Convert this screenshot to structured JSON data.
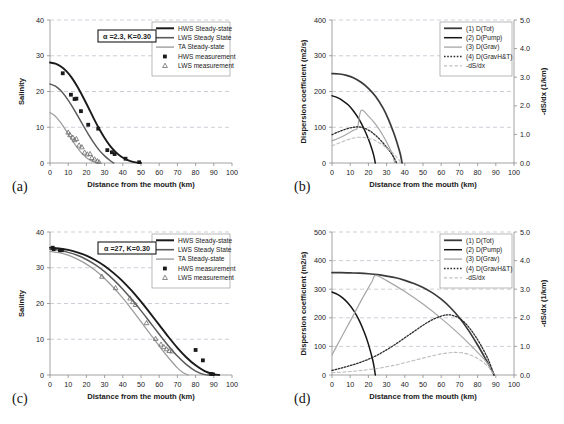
{
  "figure": {
    "panels": [
      "a",
      "b",
      "c",
      "d"
    ]
  },
  "common": {
    "xlabel": "Distance from the mouth (km)",
    "xticks": [
      0,
      10,
      20,
      30,
      40,
      50,
      60,
      70,
      80,
      90,
      100
    ],
    "xlim": [
      0,
      100
    ]
  },
  "colors": {
    "hws": "#1a1a1a",
    "lws": "#5a5a5a",
    "ta": "#9e9e9e",
    "dtot": "#3a3a3a",
    "dpump": "#161616",
    "dgrav": "#a6a6a6",
    "dgravht": "#2b2b2b",
    "dsdx": "#bdbdbd",
    "grid": "#b9b9c8",
    "axis": "#8a8a8a"
  },
  "chart_data": [
    {
      "id": "a",
      "panel_label": "(a)",
      "type": "line",
      "title": "",
      "xlabel": "Distance from the mouth (km)",
      "ylabel": "Salinity",
      "xlim": [
        0,
        100
      ],
      "ylim": [
        0,
        40
      ],
      "xticks": [
        0,
        10,
        20,
        30,
        40,
        50,
        60,
        70,
        80,
        90,
        100
      ],
      "yticks": [
        0,
        10,
        20,
        30,
        40
      ],
      "grid": true,
      "legend_position": "top-right",
      "annotation": "α =2.3, K=0.30",
      "legend": [
        {
          "label": "HWS Steady-state",
          "marker": "line",
          "color": "#1a1a1a",
          "width": 2.0
        },
        {
          "label": "LWS Steady State",
          "marker": "line",
          "color": "#5a5a5a",
          "width": 1.6
        },
        {
          "label": "TA Steady-state",
          "marker": "line",
          "color": "#9e9e9e",
          "width": 1.4
        },
        {
          "label": "HWS measurement",
          "marker": "square",
          "color": "#1a1a1a"
        },
        {
          "label": "LWS measurement",
          "marker": "triangle",
          "color": "#6b6b6b"
        }
      ],
      "series": [
        {
          "name": "HWS Steady-state",
          "style": "line",
          "color": "#1a1a1a",
          "x": [
            0,
            3,
            6,
            9,
            12,
            15,
            18,
            21,
            24,
            27,
            30,
            33,
            36,
            39,
            42,
            45,
            48,
            50
          ],
          "y": [
            28.1,
            27.8,
            27.0,
            25.7,
            23.8,
            21.4,
            18.6,
            15.6,
            12.5,
            9.6,
            7.0,
            4.8,
            3.1,
            1.8,
            0.95,
            0.4,
            0.1,
            0.0
          ]
        },
        {
          "name": "LWS Steady State",
          "style": "line",
          "color": "#5a5a5a",
          "x": [
            0,
            3,
            6,
            9,
            12,
            15,
            18,
            21,
            24,
            27,
            30,
            33,
            35
          ],
          "y": [
            22.1,
            21.5,
            20.2,
            18.3,
            16.0,
            13.4,
            10.7,
            8.1,
            5.7,
            3.6,
            2.0,
            0.7,
            0.0
          ]
        },
        {
          "name": "TA Steady-state",
          "style": "line",
          "color": "#9e9e9e",
          "x": [
            0,
            2,
            4,
            6,
            8,
            10,
            12,
            14,
            16,
            18,
            20,
            22,
            24,
            26,
            27
          ],
          "y": [
            14.1,
            13.5,
            12.5,
            11.2,
            9.7,
            8.1,
            6.5,
            5.0,
            3.6,
            2.4,
            1.5,
            0.8,
            0.3,
            0.05,
            0.0
          ]
        },
        {
          "name": "HWS measurement",
          "style": "square",
          "color": "#1a1a1a",
          "x": [
            7.0,
            11.5,
            13.5,
            14.5,
            17.0,
            21.0,
            26.5,
            31.5,
            34.0,
            35.5,
            41.5,
            49.0
          ],
          "y": [
            25.1,
            19.1,
            17.9,
            18.0,
            14.5,
            10.7,
            9.6,
            3.6,
            3.0,
            2.5,
            1.2,
            0.2
          ]
        },
        {
          "name": "LWS measurement",
          "style": "triangle",
          "color": "#6b6b6b",
          "x": [
            10.0,
            11.0,
            12.5,
            13.5,
            14.5,
            16.0,
            17.5,
            19.0,
            20.5,
            22.0,
            23.0,
            24.5,
            26.0,
            27.0
          ],
          "y": [
            8.6,
            7.9,
            7.2,
            6.5,
            6.8,
            5.0,
            4.5,
            3.0,
            2.5,
            2.6,
            1.5,
            1.1,
            0.6,
            0.3
          ]
        }
      ]
    },
    {
      "id": "b",
      "panel_label": "(b)",
      "type": "line",
      "title": "",
      "xlabel": "Distance from the mouth (km)",
      "ylabel": "Dispersion coefficient (m2/s)",
      "ylabel_right": "-dS/dx (1/km)",
      "xlim": [
        0,
        100
      ],
      "ylim": [
        0,
        400
      ],
      "ylim_right": [
        0,
        5.0
      ],
      "xticks": [
        0,
        10,
        20,
        30,
        40,
        50,
        60,
        70,
        80,
        90,
        100
      ],
      "yticks": [
        0,
        100,
        200,
        300,
        400
      ],
      "yticks_right": [
        "0.0",
        "1.0",
        "2.0",
        "3.0",
        "4.0",
        "5.0"
      ],
      "grid": true,
      "legend_position": "top-right",
      "legend": [
        {
          "label": "(1) D(Tot)",
          "marker": "line",
          "color": "#3a3a3a",
          "width": 1.8
        },
        {
          "label": "(2) D(Pump)",
          "marker": "line",
          "color": "#161616",
          "width": 1.5
        },
        {
          "label": "(3) D(Grav)",
          "marker": "line",
          "color": "#a6a6a6",
          "width": 1.3
        },
        {
          "label": "(4) D(GravH&T)",
          "marker": "dotted",
          "color": "#2b2b2b",
          "width": 1.3
        },
        {
          "label": "-dS/dx",
          "marker": "dashed",
          "color": "#bdbdbd",
          "width": 1.1
        }
      ],
      "series": [
        {
          "name": "(1) D(Tot)",
          "style": "line",
          "color": "#3a3a3a",
          "x": [
            0,
            4,
            8,
            12,
            16,
            20,
            24,
            28,
            31,
            34,
            36,
            37.5,
            38.5
          ],
          "y": [
            250,
            249,
            245,
            238,
            226,
            209,
            186,
            154,
            122,
            83,
            52,
            26,
            0
          ]
        },
        {
          "name": "(2) D(Pump)",
          "style": "line",
          "color": "#161616",
          "x": [
            0,
            3,
            6,
            9,
            12,
            15,
            18,
            20,
            22,
            23,
            23.8
          ],
          "y": [
            188,
            183,
            174,
            162,
            144,
            121,
            91,
            67,
            38,
            20,
            0
          ]
        },
        {
          "name": "(3) D(Grav)",
          "style": "line",
          "color": "#a6a6a6",
          "x": [
            0,
            3,
            6,
            9,
            12,
            14,
            16,
            20,
            24,
            28,
            31,
            33,
            34.5
          ],
          "y": [
            62,
            68,
            75,
            83,
            92,
            99,
            147,
            131,
            108,
            77,
            49,
            27,
            0
          ]
        },
        {
          "name": "(4) D(GravH&T)",
          "style": "dotted",
          "color": "#2b2b2b",
          "x": [
            0,
            3,
            6,
            9,
            12,
            14,
            16,
            18,
            21,
            24,
            27,
            30,
            32,
            34,
            35.5
          ],
          "y": [
            79,
            86,
            92,
            97,
            100,
            101,
            100,
            97,
            89,
            77,
            62,
            44,
            31,
            16,
            0
          ]
        },
        {
          "name": "-dS/dx",
          "style": "dashed",
          "color": "#bdbdbd",
          "x": [
            0,
            3,
            6,
            9,
            12,
            15,
            18,
            21,
            24,
            27,
            30,
            33,
            36,
            38
          ],
          "y": [
            48,
            54,
            60,
            66,
            70,
            72,
            71,
            68,
            62,
            53,
            42,
            30,
            14,
            0
          ]
        }
      ]
    },
    {
      "id": "c",
      "panel_label": "(c)",
      "type": "line",
      "title": "",
      "xlabel": "Distance from the mouth (km)",
      "ylabel": "Salinity",
      "xlim": [
        0,
        100
      ],
      "ylim": [
        0,
        40
      ],
      "xticks": [
        0,
        10,
        20,
        30,
        40,
        50,
        60,
        70,
        80,
        90,
        100
      ],
      "yticks": [
        0,
        10,
        20,
        30,
        40
      ],
      "grid": true,
      "legend_position": "top-right",
      "annotation": "α =27, K=0.30",
      "legend": [
        {
          "label": "HWS Steady-state",
          "marker": "line",
          "color": "#1a1a1a",
          "width": 2.0
        },
        {
          "label": "LWS Steady State",
          "marker": "line",
          "color": "#5a5a5a",
          "width": 1.6
        },
        {
          "label": "TA Steady-state",
          "marker": "line",
          "color": "#9e9e9e",
          "width": 1.4
        },
        {
          "label": "HWS measurement",
          "marker": "square",
          "color": "#1a1a1a"
        },
        {
          "label": "LWS measurement",
          "marker": "triangle",
          "color": "#6b6b6b"
        }
      ],
      "series": [
        {
          "name": "HWS Steady-state",
          "style": "line",
          "color": "#1a1a1a",
          "x": [
            0,
            5,
            10,
            15,
            20,
            25,
            30,
            35,
            40,
            45,
            50,
            55,
            60,
            65,
            70,
            75,
            80,
            85,
            90,
            93
          ],
          "y": [
            35.6,
            35.4,
            35.0,
            34.3,
            33.4,
            32.1,
            30.5,
            28.5,
            26.2,
            23.5,
            20.5,
            17.3,
            14.0,
            10.7,
            7.6,
            4.9,
            2.7,
            1.1,
            0.2,
            0.0
          ]
        },
        {
          "name": "LWS Steady State",
          "style": "line",
          "color": "#5a5a5a",
          "x": [
            0,
            5,
            10,
            15,
            20,
            25,
            30,
            35,
            40,
            45,
            50,
            55,
            60,
            65,
            70,
            75,
            80,
            85,
            88
          ],
          "y": [
            35.2,
            34.9,
            34.3,
            33.5,
            32.3,
            30.8,
            28.9,
            26.6,
            24.0,
            21.1,
            18.0,
            14.7,
            11.4,
            8.2,
            5.3,
            2.9,
            1.1,
            0.1,
            0.0
          ]
        },
        {
          "name": "TA Steady-state",
          "style": "line",
          "color": "#9e9e9e",
          "x": [
            0,
            5,
            10,
            15,
            20,
            25,
            30,
            35,
            40,
            45,
            50,
            55,
            60,
            65,
            70,
            73,
            76
          ],
          "y": [
            34.6,
            34.2,
            33.5,
            32.4,
            31.0,
            29.2,
            27.0,
            24.4,
            21.5,
            18.3,
            14.9,
            11.5,
            8.1,
            4.9,
            2.0,
            0.7,
            0.0
          ]
        },
        {
          "name": "HWS measurement",
          "style": "square",
          "color": "#1a1a1a",
          "x": [
            1.5,
            2.0,
            5.5,
            6.5,
            80.0,
            84.0,
            88.5,
            89.5
          ],
          "y": [
            35.6,
            35.2,
            34.9,
            34.9,
            7.0,
            4.1,
            0.3,
            0.2
          ]
        },
        {
          "name": "LWS measurement",
          "style": "triangle",
          "color": "#6b6b6b",
          "x": [
            28.5,
            36.0,
            44.0,
            45.5,
            47.0,
            53.0,
            58.0,
            61.0,
            62.5,
            64.0,
            65.5,
            67.0
          ],
          "y": [
            27.6,
            24.4,
            21.5,
            20.5,
            19.7,
            14.6,
            10.2,
            8.6,
            7.9,
            7.3,
            6.8,
            6.7
          ]
        }
      ]
    },
    {
      "id": "d",
      "panel_label": "(d)",
      "type": "line",
      "title": "",
      "xlabel": "Distance from the mouth (km)",
      "ylabel": "Dispersion coefficient (m2/s)",
      "ylabel_right": "-dS/dx (1/km)",
      "xlim": [
        0,
        100
      ],
      "ylim": [
        0,
        500
      ],
      "ylim_right": [
        0,
        5.0
      ],
      "xticks": [
        0,
        10,
        20,
        30,
        40,
        50,
        60,
        70,
        80,
        90,
        100
      ],
      "yticks": [
        0,
        100,
        200,
        300,
        400,
        500
      ],
      "yticks_right": [
        "0.0",
        "1.0",
        "2.0",
        "3.0",
        "4.0",
        "5.0"
      ],
      "grid": true,
      "legend_position": "top-right",
      "legend": [
        {
          "label": "(1) D(Tot)",
          "marker": "line",
          "color": "#3a3a3a",
          "width": 1.8
        },
        {
          "label": "(2) D(Pump)",
          "marker": "line",
          "color": "#161616",
          "width": 1.5
        },
        {
          "label": "(3) D(Grav)",
          "marker": "line",
          "color": "#a6a6a6",
          "width": 1.3
        },
        {
          "label": "(4) D(GravH&T)",
          "marker": "dotted",
          "color": "#2b2b2b",
          "width": 1.3
        },
        {
          "label": "-dS/dx",
          "marker": "dashed",
          "color": "#bdbdbd",
          "width": 1.1
        }
      ],
      "series": [
        {
          "name": "(1) D(Tot)",
          "style": "line",
          "color": "#3a3a3a",
          "x": [
            0,
            5,
            10,
            15,
            20,
            25,
            30,
            35,
            40,
            45,
            50,
            55,
            60,
            65,
            70,
            75,
            80,
            84,
            87,
            89
          ],
          "y": [
            358,
            358,
            357,
            356,
            354,
            351,
            346,
            340,
            331,
            320,
            306,
            288,
            265,
            236,
            200,
            156,
            105,
            61,
            26,
            0
          ]
        },
        {
          "name": "(2) D(Pump)",
          "style": "line",
          "color": "#161616",
          "x": [
            0,
            3,
            6,
            9,
            12,
            15,
            18,
            20,
            22,
            23,
            23.8
          ],
          "y": [
            290,
            282,
            269,
            250,
            224,
            190,
            145,
            108,
            62,
            33,
            0
          ]
        },
        {
          "name": "(3) D(Grav)",
          "style": "line",
          "color": "#a6a6a6",
          "x": [
            0,
            4,
            8,
            12,
            16,
            20,
            22,
            24,
            30,
            40,
            50,
            60,
            70,
            78,
            84,
            88,
            89
          ],
          "y": [
            70,
            118,
            165,
            212,
            260,
            305,
            327,
            348,
            330,
            292,
            248,
            198,
            142,
            92,
            52,
            18,
            0
          ]
        },
        {
          "name": "(4) D(GravH&T)",
          "style": "dotted",
          "color": "#2b2b2b",
          "x": [
            0,
            5,
            10,
            15,
            20,
            25,
            30,
            35,
            40,
            45,
            50,
            55,
            60,
            63,
            66,
            70,
            74,
            78,
            82,
            86,
            89
          ],
          "y": [
            16,
            24,
            33,
            43,
            55,
            70,
            88,
            108,
            130,
            152,
            174,
            193,
            206,
            210,
            209,
            198,
            176,
            143,
            102,
            52,
            0
          ]
        },
        {
          "name": "-dS/dx",
          "style": "dashed",
          "color": "#bdbdbd",
          "x": [
            0,
            5,
            10,
            15,
            20,
            25,
            30,
            35,
            40,
            45,
            50,
            55,
            60,
            65,
            68,
            72,
            76,
            80,
            84,
            87,
            89
          ],
          "y": [
            8,
            10,
            12,
            15,
            19,
            23,
            29,
            35,
            43,
            51,
            59,
            67,
            74,
            78,
            79,
            77,
            70,
            58,
            40,
            20,
            0
          ]
        }
      ]
    }
  ]
}
